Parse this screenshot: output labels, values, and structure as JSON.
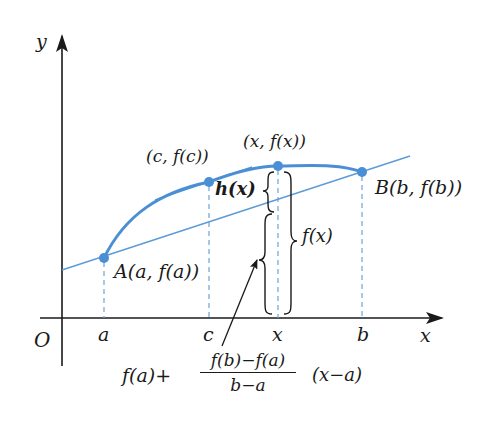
{
  "colors": {
    "axis": "#1a1a1a",
    "curve": "#4a8fd6",
    "secant": "#5b9bd8",
    "dashed": "#6fa3d8",
    "point": "#4a8fd6",
    "text": "#1a1a1a"
  },
  "axes": {
    "x_label": "x",
    "y_label": "y",
    "origin_label": "O"
  },
  "x_ticks": [
    {
      "label": "a",
      "px": 104
    },
    {
      "label": "c",
      "px": 209
    },
    {
      "label": "x",
      "px": 278
    },
    {
      "label": "b",
      "px": 362
    }
  ],
  "points": {
    "A": {
      "label": "A(a, f(a))",
      "px": [
        104,
        258
      ]
    },
    "C": {
      "label": "(c, f(c))",
      "px": [
        209,
        182
      ]
    },
    "X": {
      "label": "(x, f(x))",
      "px": [
        278,
        166
      ]
    },
    "B": {
      "label": "B(b, f(b))",
      "px": [
        362,
        172
      ]
    }
  },
  "braces": {
    "h": {
      "label": "h(x)"
    },
    "f": {
      "label": "f(x)"
    }
  },
  "formula": {
    "lead": "f(a)+",
    "numerator": "f(b)−f(a)",
    "denominator": "b−a",
    "tail": "(x−a)"
  }
}
